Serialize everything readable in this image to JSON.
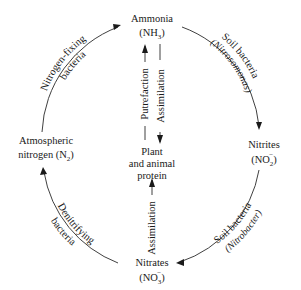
{
  "nodes": {
    "ammonia": {
      "name": "Ammonia",
      "formula_base": "(NH",
      "formula_sub": "3",
      "formula_close": ")"
    },
    "nitrites": {
      "name": "Nitrites",
      "formula_base": "(NO",
      "formula_sub": "2",
      "formula_sup": "−",
      "formula_close": ")"
    },
    "nitrates": {
      "name": "Nitrates",
      "formula_base": "(NO",
      "formula_sub": "3",
      "formula_sup": "−",
      "formula_close": ")"
    },
    "atmospheric": {
      "name_line1": "Atmospheric",
      "name_line2": "nitrogen (N",
      "formula_sub": "2",
      "formula_close": ")"
    },
    "protein": {
      "line1": "Plant",
      "line2": "and animal",
      "line3": "protein"
    }
  },
  "edges": {
    "nitrogen_fixing": {
      "line1": "Nitrogen-fixing",
      "line2": "bacteria"
    },
    "nitrosomonas": {
      "line1": "Soil bacteria",
      "line2": "(Nitrosomonas)"
    },
    "nitrobacter": {
      "line1": "Soil bacteria",
      "line2": "(Nitrobacter)"
    },
    "denitrifying": {
      "line1": "Denitrifying",
      "line2": "bacteria"
    },
    "putrefaction": {
      "label": "Putrefaction"
    },
    "assimilation_top": {
      "label": "Assimilation"
    },
    "assimilation_bottom": {
      "label": "Assimilation"
    }
  }
}
